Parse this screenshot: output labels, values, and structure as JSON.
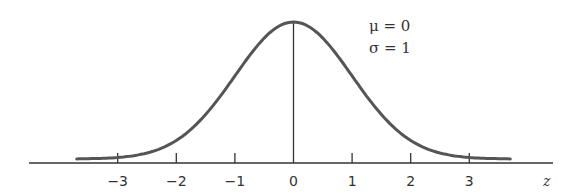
{
  "chart_data": {
    "type": "line",
    "title": "",
    "xlabel": "z",
    "ylabel": "",
    "xlim": [
      -3.7,
      3.7
    ],
    "x_ticks": [
      -3,
      -2,
      -1,
      0,
      1,
      2,
      3
    ],
    "x_tick_labels": [
      "−3",
      "−2",
      "−1",
      "0",
      "1",
      "2",
      "3"
    ],
    "grid": false,
    "legend": null,
    "series": [
      {
        "name": "Standard normal density",
        "distribution": "normal",
        "mean": 0,
        "sd": 1
      }
    ],
    "annotations": [
      {
        "text": "μ = 0"
      },
      {
        "text": "σ = 1"
      }
    ],
    "mean_line_at": 0
  },
  "colors": {
    "curve": "#555555",
    "axis": "#333333"
  }
}
